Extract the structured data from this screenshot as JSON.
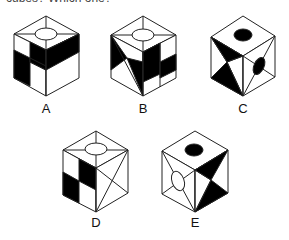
{
  "question": {
    "cropped_prompt": "cubes? Which one?"
  },
  "options": [
    {
      "id": "A",
      "label": "A",
      "top_mark": "ellipse-outline"
    },
    {
      "id": "B",
      "label": "B",
      "top_mark": "ellipse-outline"
    },
    {
      "id": "C",
      "label": "C",
      "top_mark": "ellipse-filled",
      "right_mark": "ellipse-filled"
    },
    {
      "id": "D",
      "label": "D",
      "top_mark": "ellipse-outline"
    },
    {
      "id": "E",
      "label": "E",
      "top_mark": "ellipse-filled",
      "left_mark": "ellipse-outline"
    }
  ],
  "colors": {
    "stroke": "#222222",
    "fill": "#000000",
    "background": "#ffffff"
  }
}
